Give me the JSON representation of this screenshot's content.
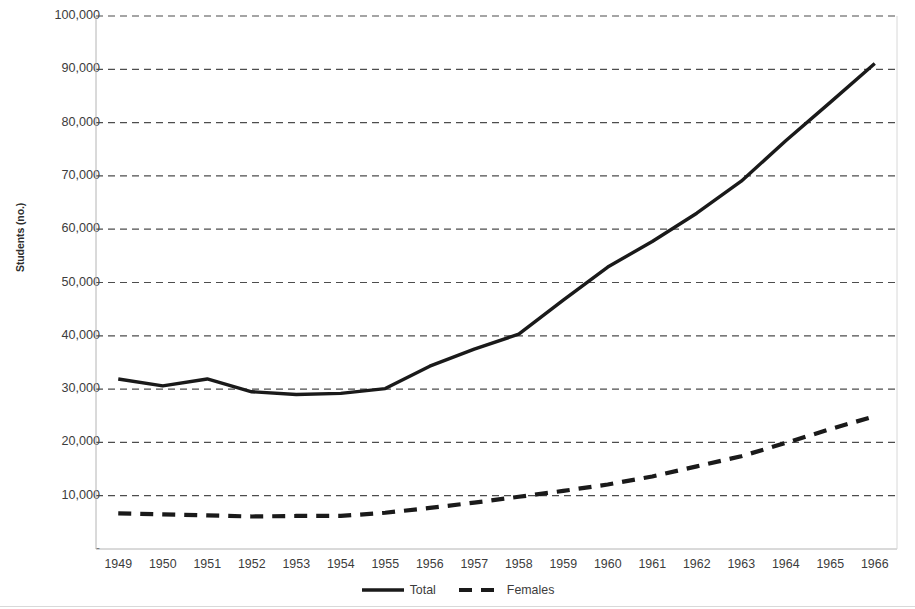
{
  "chart_data": {
    "type": "line",
    "title": "",
    "xlabel": "",
    "ylabel": "Students (no.)",
    "x": [
      1949,
      1950,
      1951,
      1952,
      1953,
      1954,
      1955,
      1956,
      1957,
      1958,
      1959,
      1960,
      1961,
      1962,
      1963,
      1964,
      1965,
      1966
    ],
    "categories": [
      "1949",
      "1950",
      "1951",
      "1952",
      "1953",
      "1954",
      "1955",
      "1956",
      "1957",
      "1958",
      "1959",
      "1960",
      "1961",
      "1962",
      "1963",
      "1964",
      "1965",
      "1966"
    ],
    "series": [
      {
        "name": "Total",
        "style": "solid",
        "color": "#1a1a1a",
        "values": [
          31900,
          30600,
          31900,
          29500,
          29000,
          29200,
          30100,
          34300,
          37500,
          40300,
          46700,
          52900,
          57700,
          63000,
          69000,
          76600,
          83800,
          91100
        ]
      },
      {
        "name": "Females",
        "style": "dashed",
        "color": "#1a1a1a",
        "values": [
          6700,
          6500,
          6300,
          6100,
          6200,
          6200,
          6800,
          7700,
          8700,
          9800,
          10900,
          12100,
          13600,
          15500,
          17400,
          19900,
          22500,
          24900
        ]
      }
    ],
    "ylim": [
      0,
      100000
    ],
    "ytick_labels": [
      "100,000",
      "90,000",
      "80,000",
      "70,000",
      "60,000",
      "50,000",
      "40,000",
      "30,000",
      "20,000",
      "10,000",
      "-"
    ],
    "ytick_values": [
      100000,
      90000,
      80000,
      70000,
      60000,
      50000,
      40000,
      30000,
      20000,
      10000,
      0
    ],
    "grid": "horizontal-dashed",
    "legend_position": "bottom-center"
  },
  "legend": {
    "entries": [
      {
        "label": "Total",
        "style": "solid"
      },
      {
        "label": "Females",
        "style": "dashed"
      }
    ]
  }
}
